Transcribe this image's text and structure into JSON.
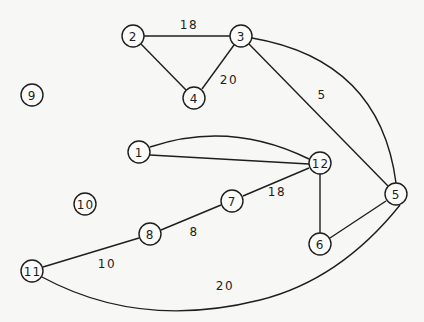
{
  "diagram": {
    "type": "weighted-undirected-graph",
    "nodes": [
      {
        "id": "1",
        "label": "1",
        "x": 139,
        "y": 152
      },
      {
        "id": "2",
        "label": "2",
        "x": 133,
        "y": 36
      },
      {
        "id": "3",
        "label": "3",
        "x": 241,
        "y": 36
      },
      {
        "id": "4",
        "label": "4",
        "x": 194,
        "y": 98
      },
      {
        "id": "5",
        "label": "5",
        "x": 396,
        "y": 194
      },
      {
        "id": "6",
        "label": "6",
        "x": 320,
        "y": 244
      },
      {
        "id": "7",
        "label": "7",
        "x": 232,
        "y": 201
      },
      {
        "id": "8",
        "label": "8",
        "x": 150,
        "y": 234
      },
      {
        "id": "9",
        "label": "9",
        "x": 32,
        "y": 95
      },
      {
        "id": "10",
        "label": "10",
        "x": 85,
        "y": 204
      },
      {
        "id": "11",
        "label": "11",
        "x": 32,
        "y": 271
      },
      {
        "id": "12",
        "label": "12",
        "x": 320,
        "y": 163
      }
    ],
    "edges": [
      {
        "from": "2",
        "to": "3",
        "weight": "18",
        "label_x": 189,
        "label_y": 25,
        "path": "M144 36 L230 36"
      },
      {
        "from": "2",
        "to": "4",
        "weight": "",
        "path": "M141 44 L186 90"
      },
      {
        "from": "3",
        "to": "4",
        "weight": "20",
        "label_x": 229,
        "label_y": 80,
        "path": "M234 45 L202 89"
      },
      {
        "from": "3",
        "to": "5",
        "weight": "5",
        "label_x": 322,
        "label_y": 95,
        "path": "M249 44 L388 186"
      },
      {
        "from": "3",
        "to": "5",
        "weight": "",
        "path": "M252 38 Q380 60 396 183"
      },
      {
        "from": "1",
        "to": "12",
        "weight": "",
        "path": "M150 147 Q230 120 309 159"
      },
      {
        "from": "1",
        "to": "12",
        "weight": "",
        "path": "M150 155 L309 164"
      },
      {
        "from": "12",
        "to": "7",
        "weight": "18",
        "label_x": 277,
        "label_y": 192,
        "path": "M309 168 L243 196"
      },
      {
        "from": "12",
        "to": "6",
        "weight": "",
        "path": "M320 174 L320 233"
      },
      {
        "from": "6",
        "to": "5",
        "weight": "",
        "path": "M330 238 L386 201"
      },
      {
        "from": "7",
        "to": "8",
        "weight": "8",
        "label_x": 194,
        "label_y": 232,
        "path": "M221 205 L161 230"
      },
      {
        "from": "8",
        "to": "11",
        "weight": "10",
        "label_x": 107,
        "label_y": 264,
        "path": "M139 238 L43 267"
      },
      {
        "from": "11",
        "to": "5",
        "weight": "20",
        "label_x": 225,
        "label_y": 286,
        "path": "M42 277 Q140 330 260 300 Q340 280 400 205"
      }
    ]
  }
}
